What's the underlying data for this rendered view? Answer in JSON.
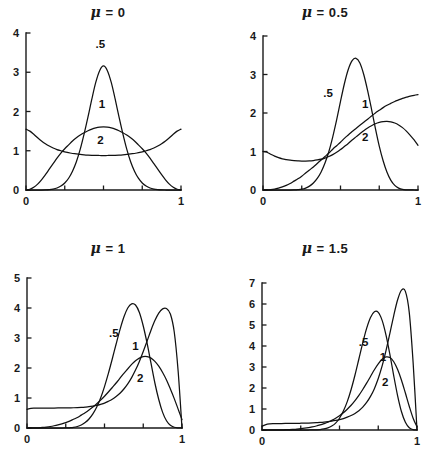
{
  "figure": {
    "background": "#ffffff",
    "ink": "#111111",
    "panel_count": 4
  },
  "chart_data": [
    {
      "type": "line",
      "panel_id": "mu-0",
      "title": "μ = 0",
      "mu": 0,
      "xlabel": "",
      "ylabel": "",
      "xlim": [
        0,
        1
      ],
      "ylim": [
        0,
        4
      ],
      "xticks": [
        0,
        0.25,
        0.5,
        0.75,
        1
      ],
      "xtick_labels": [
        "0",
        "",
        "",
        "",
        "1"
      ],
      "yticks": [
        0,
        1,
        2,
        3,
        4
      ],
      "ytick_labels": [
        "0",
        "1",
        "2",
        "3",
        "4"
      ],
      "grid": false,
      "legend": "inline-labels",
      "x": [
        0,
        0.025,
        0.05,
        0.075,
        0.1,
        0.125,
        0.15,
        0.175,
        0.2,
        0.225,
        0.25,
        0.275,
        0.3,
        0.325,
        0.35,
        0.375,
        0.4,
        0.425,
        0.45,
        0.475,
        0.5,
        0.525,
        0.55,
        0.575,
        0.6,
        0.625,
        0.65,
        0.675,
        0.7,
        0.725,
        0.75,
        0.775,
        0.8,
        0.825,
        0.85,
        0.875,
        0.9,
        0.925,
        0.95,
        0.975,
        1
      ],
      "series": [
        {
          "name": ".5",
          "label": ".5",
          "label_x": 0.48,
          "label_y": 3.62,
          "values": [
            0,
            0,
            0,
            0,
            0,
            0.002,
            0.008,
            0.022,
            0.05,
            0.1,
            0.18,
            0.3,
            0.48,
            0.72,
            1.04,
            1.43,
            1.86,
            2.32,
            2.74,
            3.04,
            3.16,
            3.04,
            2.74,
            2.32,
            1.86,
            1.43,
            1.04,
            0.72,
            0.48,
            0.3,
            0.18,
            0.1,
            0.05,
            0.022,
            0.008,
            0.002,
            0,
            0,
            0,
            0,
            0
          ]
        },
        {
          "name": "1",
          "label": "1",
          "label_x": 0.49,
          "label_y": 2.08,
          "values": [
            0,
            0.02,
            0.07,
            0.15,
            0.26,
            0.39,
            0.53,
            0.67,
            0.81,
            0.94,
            1.05,
            1.15,
            1.25,
            1.33,
            1.4,
            1.46,
            1.51,
            1.55,
            1.58,
            1.6,
            1.61,
            1.6,
            1.58,
            1.55,
            1.51,
            1.46,
            1.4,
            1.33,
            1.25,
            1.15,
            1.05,
            0.94,
            0.81,
            0.67,
            0.53,
            0.39,
            0.26,
            0.15,
            0.07,
            0.02,
            0
          ]
        },
        {
          "name": "2",
          "label": "2",
          "label_x": 0.48,
          "label_y": 1.18,
          "values": [
            1.55,
            1.5,
            1.42,
            1.33,
            1.25,
            1.18,
            1.12,
            1.07,
            1.03,
            1.0,
            0.97,
            0.95,
            0.93,
            0.92,
            0.905,
            0.895,
            0.888,
            0.883,
            0.88,
            0.879,
            0.878,
            0.879,
            0.88,
            0.883,
            0.888,
            0.895,
            0.905,
            0.92,
            0.93,
            0.95,
            0.97,
            1.0,
            1.03,
            1.07,
            1.12,
            1.18,
            1.25,
            1.33,
            1.42,
            1.5,
            1.55
          ]
        }
      ]
    },
    {
      "type": "line",
      "panel_id": "mu-0.5",
      "title": "μ = 0.5",
      "mu": 0.5,
      "xlabel": "",
      "ylabel": "",
      "xlim": [
        0,
        1
      ],
      "ylim": [
        0,
        4
      ],
      "xticks": [
        0,
        0.25,
        0.5,
        0.75,
        1
      ],
      "xtick_labels": [
        "0",
        "",
        "",
        "",
        "1"
      ],
      "yticks": [
        0,
        1,
        2,
        3,
        4
      ],
      "ytick_labels": [
        "0",
        "1",
        "2",
        "3",
        "4"
      ],
      "grid": false,
      "legend": "inline-labels",
      "x": [
        0,
        0.025,
        0.05,
        0.075,
        0.1,
        0.125,
        0.15,
        0.175,
        0.2,
        0.225,
        0.25,
        0.275,
        0.3,
        0.325,
        0.35,
        0.375,
        0.4,
        0.425,
        0.45,
        0.475,
        0.5,
        0.525,
        0.55,
        0.575,
        0.6,
        0.625,
        0.65,
        0.675,
        0.7,
        0.725,
        0.75,
        0.775,
        0.8,
        0.825,
        0.85,
        0.875,
        0.9,
        0.925,
        0.95,
        0.975,
        1
      ],
      "series": [
        {
          "name": ".5",
          "label": ".5",
          "label_x": 0.42,
          "label_y": 2.42,
          "values": [
            0,
            0,
            0,
            0,
            0,
            0,
            0,
            0,
            0.002,
            0.008,
            0.02,
            0.05,
            0.1,
            0.18,
            0.3,
            0.47,
            0.7,
            1.0,
            1.38,
            1.82,
            2.3,
            2.76,
            3.13,
            3.36,
            3.42,
            3.3,
            3.0,
            2.58,
            2.1,
            1.6,
            1.14,
            0.76,
            0.46,
            0.25,
            0.12,
            0.05,
            0.015,
            0.004,
            0.001,
            0,
            0
          ]
        },
        {
          "name": "1",
          "label": "1",
          "label_x": 0.66,
          "label_y": 2.12,
          "values": [
            0,
            0.002,
            0.01,
            0.025,
            0.05,
            0.08,
            0.12,
            0.17,
            0.23,
            0.29,
            0.36,
            0.44,
            0.52,
            0.6,
            0.69,
            0.78,
            0.87,
            0.96,
            1.06,
            1.15,
            1.24,
            1.34,
            1.43,
            1.52,
            1.6,
            1.68,
            1.76,
            1.84,
            1.92,
            2.0,
            2.07,
            2.14,
            2.2,
            2.25,
            2.3,
            2.34,
            2.38,
            2.41,
            2.44,
            2.46,
            2.48
          ]
        },
        {
          "name": "2",
          "label": "2",
          "label_x": 0.66,
          "label_y": 1.28,
          "values": [
            1.0,
            0.98,
            0.93,
            0.88,
            0.84,
            0.81,
            0.79,
            0.775,
            0.765,
            0.758,
            0.753,
            0.752,
            0.755,
            0.765,
            0.78,
            0.8,
            0.83,
            0.87,
            0.92,
            0.98,
            1.05,
            1.13,
            1.21,
            1.3,
            1.38,
            1.46,
            1.54,
            1.61,
            1.67,
            1.72,
            1.755,
            1.775,
            1.78,
            1.77,
            1.74,
            1.69,
            1.62,
            1.53,
            1.42,
            1.3,
            1.16
          ]
        }
      ]
    },
    {
      "type": "line",
      "panel_id": "mu-1",
      "title": "μ = 1",
      "mu": 1,
      "xlabel": "",
      "ylabel": "",
      "xlim": [
        0,
        1
      ],
      "ylim": [
        0,
        5
      ],
      "xticks": [
        0,
        0.25,
        0.5,
        0.75,
        1
      ],
      "xtick_labels": [
        "0",
        "",
        "",
        "",
        "1"
      ],
      "yticks": [
        0,
        1,
        2,
        3,
        4,
        5
      ],
      "ytick_labels": [
        "0",
        "1",
        "2",
        "3",
        "4",
        "5"
      ],
      "grid": false,
      "legend": "inline-labels",
      "x": [
        0,
        0.025,
        0.05,
        0.075,
        0.1,
        0.125,
        0.15,
        0.175,
        0.2,
        0.225,
        0.25,
        0.275,
        0.3,
        0.325,
        0.35,
        0.375,
        0.4,
        0.425,
        0.45,
        0.475,
        0.5,
        0.525,
        0.55,
        0.575,
        0.6,
        0.625,
        0.65,
        0.675,
        0.7,
        0.725,
        0.75,
        0.775,
        0.8,
        0.825,
        0.85,
        0.875,
        0.9,
        0.925,
        0.95,
        0.975,
        1
      ],
      "series": [
        {
          "name": ".5",
          "label": ".5",
          "label_x": 0.56,
          "label_y": 3.05,
          "values": [
            0,
            0,
            0,
            0,
            0,
            0,
            0,
            0,
            0,
            0,
            0.002,
            0.008,
            0.02,
            0.05,
            0.1,
            0.18,
            0.3,
            0.47,
            0.7,
            1.0,
            1.38,
            1.82,
            2.3,
            2.8,
            3.28,
            3.7,
            4.0,
            4.14,
            4.1,
            3.85,
            3.4,
            2.82,
            2.16,
            1.5,
            0.95,
            0.52,
            0.24,
            0.09,
            0.025,
            0.004,
            0
          ]
        },
        {
          "name": "1",
          "label": "1",
          "label_x": 0.7,
          "label_y": 2.6,
          "values": [
            0,
            0.0005,
            0.003,
            0.008,
            0.018,
            0.032,
            0.05,
            0.075,
            0.105,
            0.14,
            0.18,
            0.23,
            0.29,
            0.35,
            0.43,
            0.51,
            0.6,
            0.7,
            0.81,
            0.93,
            1.06,
            1.2,
            1.35,
            1.5,
            1.66,
            1.82,
            1.97,
            2.12,
            2.24,
            2.33,
            2.38,
            2.38,
            2.33,
            2.22,
            2.06,
            1.85,
            1.6,
            1.3,
            0.98,
            0.63,
            0.28
          ]
        },
        {
          "name": "2",
          "label": "2",
          "label_x": 0.73,
          "label_y": 1.52,
          "values": [
            0.62,
            0.655,
            0.66,
            0.662,
            0.663,
            0.664,
            0.665,
            0.666,
            0.667,
            0.668,
            0.67,
            0.672,
            0.675,
            0.68,
            0.687,
            0.697,
            0.71,
            0.73,
            0.755,
            0.79,
            0.83,
            0.89,
            0.96,
            1.05,
            1.16,
            1.3,
            1.47,
            1.68,
            1.93,
            2.22,
            2.55,
            2.9,
            3.26,
            3.58,
            3.83,
            3.97,
            3.98,
            3.8,
            3.2,
            1.9,
            0
          ]
        }
      ]
    },
    {
      "type": "line",
      "panel_id": "mu-1.5",
      "title": "μ = 1.5",
      "mu": 1.5,
      "xlabel": "",
      "ylabel": "",
      "xlim": [
        0,
        1
      ],
      "ylim": [
        0,
        7
      ],
      "xticks": [
        0,
        0.25,
        0.5,
        0.75,
        1
      ],
      "xtick_labels": [
        "0",
        "",
        "",
        "",
        "1"
      ],
      "yticks": [
        0,
        1,
        2,
        3,
        4,
        5,
        6,
        7
      ],
      "ytick_labels": [
        "0",
        "1",
        "2",
        "3",
        "4",
        "5",
        "6",
        "7"
      ],
      "grid": false,
      "legend": "inline-labels",
      "x": [
        0,
        0.025,
        0.05,
        0.075,
        0.1,
        0.125,
        0.15,
        0.175,
        0.2,
        0.225,
        0.25,
        0.275,
        0.3,
        0.325,
        0.35,
        0.375,
        0.4,
        0.425,
        0.45,
        0.475,
        0.5,
        0.525,
        0.55,
        0.575,
        0.6,
        0.625,
        0.65,
        0.675,
        0.7,
        0.725,
        0.75,
        0.775,
        0.8,
        0.825,
        0.85,
        0.875,
        0.9,
        0.925,
        0.95,
        0.975,
        1
      ],
      "series": [
        {
          "name": ".5",
          "label": ".5",
          "label_x": 0.655,
          "label_y": 4.0,
          "values": [
            0,
            0,
            0,
            0,
            0,
            0,
            0,
            0,
            0,
            0,
            0,
            0,
            0,
            0.002,
            0.008,
            0.02,
            0.05,
            0.1,
            0.19,
            0.33,
            0.56,
            0.9,
            1.35,
            1.93,
            2.62,
            3.38,
            4.15,
            4.84,
            5.36,
            5.63,
            5.6,
            5.22,
            4.52,
            3.6,
            2.58,
            1.63,
            0.87,
            0.37,
            0.11,
            0.02,
            0
          ]
        },
        {
          "name": "1",
          "label": "1",
          "label_x": 0.78,
          "label_y": 3.3,
          "values": [
            0,
            0,
            0.0005,
            0.0015,
            0.004,
            0.008,
            0.014,
            0.022,
            0.033,
            0.047,
            0.065,
            0.088,
            0.115,
            0.15,
            0.19,
            0.24,
            0.3,
            0.37,
            0.46,
            0.56,
            0.68,
            0.82,
            0.99,
            1.18,
            1.4,
            1.65,
            1.93,
            2.23,
            2.55,
            2.87,
            3.15,
            3.37,
            3.48,
            3.45,
            3.25,
            2.88,
            2.37,
            1.76,
            1.13,
            0.56,
            0.15
          ]
        },
        {
          "name": "2",
          "label": "2",
          "label_x": 0.795,
          "label_y": 2.1,
          "values": [
            0.18,
            0.26,
            0.29,
            0.3,
            0.305,
            0.308,
            0.31,
            0.312,
            0.315,
            0.318,
            0.322,
            0.327,
            0.333,
            0.34,
            0.35,
            0.362,
            0.378,
            0.398,
            0.423,
            0.455,
            0.495,
            0.545,
            0.61,
            0.69,
            0.79,
            0.92,
            1.09,
            1.31,
            1.6,
            1.97,
            2.45,
            3.05,
            3.78,
            4.6,
            5.45,
            6.2,
            6.66,
            6.6,
            5.6,
            3.2,
            0
          ]
        }
      ]
    }
  ],
  "panels": [
    {
      "id": "mu-0",
      "name": "panel-mu-0",
      "left": 0,
      "top": 4,
      "width": 216,
      "height": 232,
      "plot": {
        "x0": 26,
        "y0": 190,
        "x1": 181,
        "y1": 33
      }
    },
    {
      "id": "mu-0.5",
      "name": "panel-mu-0-5",
      "left": 217,
      "top": 4,
      "width": 216,
      "height": 232,
      "plot": {
        "x0": 263,
        "y0": 190,
        "x1": 418,
        "y1": 36
      }
    },
    {
      "id": "mu-1",
      "name": "panel-mu-1",
      "left": 0,
      "top": 240,
      "width": 216,
      "height": 224,
      "plot": {
        "x0": 27,
        "y0": 428,
        "x1": 182,
        "y1": 278
      }
    },
    {
      "id": "mu-1.5",
      "name": "panel-mu-1-5",
      "left": 217,
      "top": 240,
      "width": 216,
      "height": 224,
      "plot": {
        "x0": 262,
        "y0": 430,
        "x1": 417,
        "y1": 283
      }
    }
  ]
}
